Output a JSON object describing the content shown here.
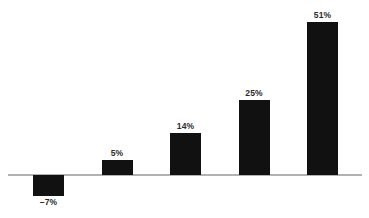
{
  "chart_data": {
    "type": "bar",
    "title": "",
    "subtitle": "",
    "xlabel": "",
    "ylabel": "",
    "categories": [
      "",
      "",
      "",
      "",
      ""
    ],
    "values": [
      -7,
      5,
      14,
      25,
      51
    ],
    "data_labels": [
      "–7%",
      "5%",
      "14%",
      "25%",
      "51%"
    ],
    "ylim": [
      -10,
      56
    ],
    "grid": false,
    "legend": null,
    "baseline_value": 0,
    "value_unit": "%",
    "bar_color": "#111111",
    "axis_color": "#b2b2b2",
    "label_color": "#2b2b2b",
    "background_color": "#ffffff",
    "annotations": []
  },
  "footer": {
    "ghost_text": ""
  }
}
